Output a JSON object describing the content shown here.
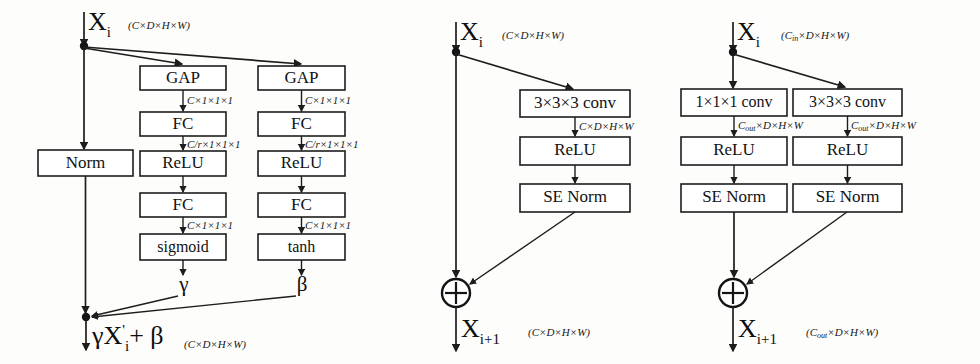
{
  "figure": {
    "background": "#fdfdfc",
    "stroke_color": "#1d1d1d",
    "text_color": "#111111"
  },
  "panels": [
    {
      "id": "se-norm",
      "name": "SE Norm block",
      "input": {
        "symbol": "X",
        "subscript": "i",
        "dims": "(C×D×H×W)"
      },
      "output": {
        "expr": "γX",
        "prime": "'",
        "subscript": "i",
        "tail": "+ β",
        "dims": "(C×D×H×W)"
      },
      "branches": [
        {
          "name": "identity",
          "blocks": [
            {
              "label": "Norm"
            }
          ],
          "edge_labels": []
        },
        {
          "name": "gamma",
          "blocks": [
            {
              "label": "GAP"
            },
            {
              "label": "FC"
            },
            {
              "label": "ReLU"
            },
            {
              "label": "FC"
            },
            {
              "label": "sigmoid"
            }
          ],
          "edge_labels": [
            "C×1×1×1",
            "C/r×1×1×1",
            "",
            "C×1×1×1"
          ],
          "output_symbol": "γ"
        },
        {
          "name": "beta",
          "blocks": [
            {
              "label": "GAP"
            },
            {
              "label": "FC"
            },
            {
              "label": "ReLU"
            },
            {
              "label": "FC"
            },
            {
              "label": "tanh"
            }
          ],
          "edge_labels": [
            "C×1×1×1",
            "C/r×1×1×1",
            "",
            "C×1×1×1"
          ],
          "output_symbol": "β"
        }
      ]
    },
    {
      "id": "residual-identity",
      "name": "Residual block with identity skip",
      "input": {
        "symbol": "X",
        "subscript": "i",
        "dims": "(C×D×H×W)"
      },
      "output": {
        "symbol": "X",
        "subscript": "i+1",
        "dims": "(C×D×H×W)"
      },
      "merge_symbol": "⊕",
      "branches": [
        {
          "name": "main",
          "blocks": [
            {
              "label": "3×3×3 conv"
            },
            {
              "label": "ReLU"
            },
            {
              "label": "SE Norm"
            }
          ],
          "edge_labels": [
            "C×D×H×W",
            ""
          ]
        }
      ]
    },
    {
      "id": "residual-projection",
      "name": "Residual block with projection shortcut",
      "input": {
        "symbol": "X",
        "subscript": "i",
        "dims_prefix": "(C",
        "dims_sub": "in",
        "dims_suffix": "×D×H×W)"
      },
      "output": {
        "symbol": "X",
        "subscript": "i+1",
        "dims_prefix": "(C",
        "dims_sub": "out",
        "dims_suffix": "×D×H×W)"
      },
      "merge_symbol": "⊕",
      "branches": [
        {
          "name": "shortcut",
          "blocks": [
            {
              "label": "1×1×1 conv"
            },
            {
              "label": "ReLU"
            },
            {
              "label": "SE Norm"
            }
          ],
          "edge_label_prefix": "C",
          "edge_label_sub": "out",
          "edge_label_suffix": "×D×H×W"
        },
        {
          "name": "main",
          "blocks": [
            {
              "label": "3×3×3 conv"
            },
            {
              "label": "ReLU"
            },
            {
              "label": "SE Norm"
            }
          ],
          "edge_label_prefix": "C",
          "edge_label_sub": "out",
          "edge_label_suffix": "×D×H×W"
        }
      ]
    }
  ]
}
